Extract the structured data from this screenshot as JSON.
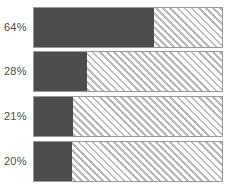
{
  "chart_data": {
    "type": "bar",
    "orientation": "horizontal",
    "stacked": true,
    "title": "",
    "subtitle": "",
    "xlabel": "",
    "ylabel": "",
    "xlim": [
      0,
      100
    ],
    "grid": false,
    "legend": false,
    "categories": [
      "",
      "",
      "",
      ""
    ],
    "data_labels": [
      "64%",
      "28%",
      "21%",
      "20%"
    ],
    "values": [
      64,
      28,
      21,
      20
    ],
    "remainder_values": [
      36,
      72,
      79,
      80
    ],
    "series": [
      {
        "name": "filled",
        "values": [
          64,
          28,
          21,
          20
        ],
        "color": "#4d4d4d",
        "pattern": "solid"
      },
      {
        "name": "remainder",
        "values": [
          36,
          72,
          79,
          80
        ],
        "color": "#ffffff",
        "pattern": "diagonal-hatch"
      }
    ]
  },
  "bars": [
    {
      "label": "64%",
      "value": 64
    },
    {
      "label": "28%",
      "value": 28
    },
    {
      "label": "21%",
      "value": 21
    },
    {
      "label": "20%",
      "value": 20
    }
  ],
  "colors": {
    "fill": "#4d4d4d",
    "hatch_line": "#b9b9b9",
    "track_background": "#ffffff",
    "track_border": "#9a9a9a",
    "label_text": "#4a4a4a",
    "page_background": "#ffffff"
  }
}
